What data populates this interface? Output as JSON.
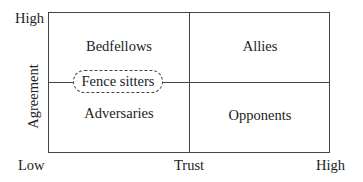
{
  "diagram": {
    "type": "2x2 quadrant matrix",
    "axes": {
      "x": {
        "label": "Trust",
        "low": "Low",
        "high": "High"
      },
      "y": {
        "label": "Agreement",
        "high": "High"
      }
    },
    "quadrants": {
      "top_left": "Bedfellows",
      "top_right": "Allies",
      "bottom_left": "Adversaries",
      "bottom_right": "Opponents"
    },
    "middle_label": "Fence sitters"
  }
}
